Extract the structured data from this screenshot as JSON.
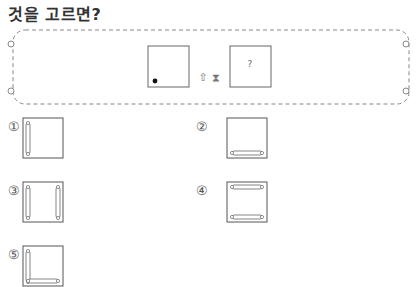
{
  "question": {
    "title": "것을 고르면?"
  },
  "problem": {
    "given_paper": {
      "mark": "dot",
      "mark_position": "bottom-left"
    },
    "operations": [
      {
        "icon": "up-arrow-fold-icon",
        "glyph": "⇧"
      },
      {
        "icon": "hourglass-icon",
        "glyph": "⧗"
      }
    ],
    "result_paper": {
      "label": "?"
    }
  },
  "options": [
    {
      "number": "①",
      "bars": [
        "left"
      ]
    },
    {
      "number": "②",
      "bars": [
        "bottom"
      ]
    },
    {
      "number": "③",
      "bars": [
        "left",
        "right"
      ]
    },
    {
      "number": "④",
      "bars": [
        "top",
        "bottom"
      ]
    },
    {
      "number": "⑤",
      "bars": [
        "left",
        "bottom"
      ]
    }
  ]
}
